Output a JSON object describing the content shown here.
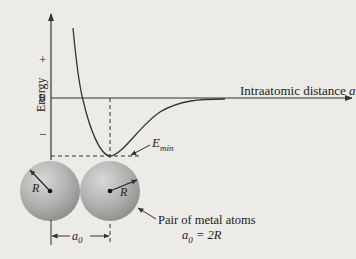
{
  "diagram": {
    "type": "energy-vs-interatomic-distance",
    "y_axis": {
      "label": "Energy",
      "plus_label": "+",
      "zero_label": "0",
      "minus_label": "−"
    },
    "x_axis": {
      "label": "Intraatomic distance ",
      "label_var": "a"
    },
    "annotations": {
      "emin_main": "E",
      "emin_sub": "min",
      "radius_left": "R",
      "radius_right": "R",
      "a0_main": "a",
      "a0_sub": "0",
      "pair_caption": "Pair of metal atoms",
      "relation_main": "a",
      "relation_sub": "0",
      "relation_rest": " = 2R"
    },
    "colors": {
      "background": "#ecebe8",
      "line": "#333333",
      "sphere_light": "#d6d6d4",
      "sphere_dark": "#8e8e8c"
    }
  }
}
